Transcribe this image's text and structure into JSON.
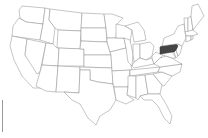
{
  "map": {
    "title": "United States",
    "highlighted_state": "Pennsylvania",
    "colors": {
      "fill": "#ffffff",
      "stroke": "#8c8c8c",
      "highlight": "#444444"
    },
    "states": [
      {
        "id": "WA",
        "name": "Washington",
        "d": "M22,6 L45,8 L43,24 L26,22 L20,18 L19,10 Z"
      },
      {
        "id": "OR",
        "name": "Oregon",
        "d": "M19,18 L26,22 L43,24 L40,40 L12,36 L13,26 Z"
      },
      {
        "id": "CA",
        "name": "California",
        "d": "M12,36 L27,39 L25,55 L44,80 L42,88 L33,88 L22,76 L14,60 L10,46 Z"
      },
      {
        "id": "NV",
        "name": "Nevada",
        "d": "M27,39 L46,43 L40,72 L37,74 L25,55 Z"
      },
      {
        "id": "ID",
        "name": "Idaho",
        "d": "M45,8 L50,9 L49,20 L55,28 L53,44 L40,40 L43,24 Z"
      },
      {
        "id": "MT",
        "name": "Montana",
        "d": "M50,9 L82,13 L81,31 L58,30 L55,28 L49,20 Z"
      },
      {
        "id": "WY",
        "name": "Wyoming",
        "d": "M58,30 L81,31 L80,49 L57,48 Z"
      },
      {
        "id": "UT",
        "name": "Utah",
        "d": "M46,43 L53,44 L57,48 L59,48 L58,66 L42,65 Z"
      },
      {
        "id": "AZ",
        "name": "Arizona",
        "d": "M42,65 L58,66 L56,92 L46,91 L36,86 L40,72 Z"
      },
      {
        "id": "CO",
        "name": "Colorado",
        "d": "M59,48 L84,49 L84,66 L58,66 Z"
      },
      {
        "id": "NM",
        "name": "New Mexico",
        "d": "M58,66 L80,67 L79,93 L64,92 L56,92 Z"
      },
      {
        "id": "ND",
        "name": "North Dakota",
        "d": "M82,13 L104,14 L106,28 L81,28 Z"
      },
      {
        "id": "SD",
        "name": "South Dakota",
        "d": "M81,28 L106,28 L107,42 L81,41 Z"
      },
      {
        "id": "NE",
        "name": "Nebraska",
        "d": "M81,41 L107,42 L111,55 L84,55 L84,49 L80,49 Z"
      },
      {
        "id": "KS",
        "name": "Kansas",
        "d": "M84,55 L111,55 L112,68 L84,67 Z"
      },
      {
        "id": "OK",
        "name": "Oklahoma",
        "d": "M80,67 L112,68 L113,84 L98,82 L90,80 L90,70 L80,70 Z"
      },
      {
        "id": "TX",
        "name": "Texas",
        "d": "M80,70 L90,70 L90,80 L98,82 L113,84 L116,100 L110,110 L100,116 L96,125 L88,118 L80,104 L72,100 L64,92 L79,93 Z"
      },
      {
        "id": "MN",
        "name": "Minnesota",
        "d": "M104,14 L112,14 L123,18 L117,24 L116,38 L107,38 L106,28 Z"
      },
      {
        "id": "IA",
        "name": "Iowa",
        "d": "M107,38 L124,38 L126,48 L110,52 L107,42 Z"
      },
      {
        "id": "MO",
        "name": "Missouri",
        "d": "M110,52 L126,48 L130,60 L132,70 L112,71 L111,55 Z"
      },
      {
        "id": "AR",
        "name": "Arkansas",
        "d": "M112,71 L130,70 L128,87 L114,87 L113,84 Z"
      },
      {
        "id": "LA",
        "name": "Louisiana",
        "d": "M114,87 L128,87 L127,95 L134,100 L126,104 L116,100 Z"
      },
      {
        "id": "WI",
        "name": "Wisconsin",
        "d": "M116,24 L125,26 L132,30 L130,42 L124,38 L116,38 Z"
      },
      {
        "id": "IL",
        "name": "Illinois",
        "d": "M124,38 L130,40 L133,54 L132,66 L128,62 L126,48 Z"
      },
      {
        "id": "MI",
        "name": "Michigan",
        "d": "M125,26 L138,22 L144,30 L146,40 L134,42 L132,30 Z"
      },
      {
        "id": "IN",
        "name": "Indiana",
        "d": "M133,44 L140,44 L140,58 L134,62 L133,54 Z"
      },
      {
        "id": "OH",
        "name": "Ohio",
        "d": "M140,44 L150,42 L154,46 L152,56 L146,60 L140,58 Z"
      },
      {
        "id": "KY",
        "name": "Kentucky",
        "d": "M132,66 L134,62 L140,58 L146,60 L152,58 L154,64 L134,68 Z"
      },
      {
        "id": "TN",
        "name": "Tennessee",
        "d": "M130,70 L160,67 L158,72 L130,76 Z"
      },
      {
        "id": "MS",
        "name": "Mississippi",
        "d": "M128,76 L136,76 L136,98 L127,95 L128,87 Z"
      },
      {
        "id": "AL",
        "name": "Alabama",
        "d": "M136,76 L145,75 L148,94 L140,96 L138,100 L136,98 Z"
      },
      {
        "id": "GA",
        "name": "Georgia",
        "d": "M145,75 L153,74 L162,85 L160,94 L148,94 Z"
      },
      {
        "id": "FL",
        "name": "Florida",
        "d": "M140,96 L148,94 L160,94 L166,104 L172,116 L170,124 L164,118 L158,106 L152,100 L144,100 Z"
      },
      {
        "id": "SC",
        "name": "South Carolina",
        "d": "M153,74 L162,72 L172,76 L164,86 L162,85 Z"
      },
      {
        "id": "NC",
        "name": "North Carolina",
        "d": "M158,72 L160,67 L182,64 L180,72 L172,76 L162,72 Z"
      },
      {
        "id": "VA",
        "name": "Virginia",
        "d": "M154,64 L160,58 L166,56 L172,58 L178,62 L182,64 L160,67 Z"
      },
      {
        "id": "WV",
        "name": "West Virginia",
        "d": "M152,56 L156,52 L160,54 L164,54 L160,58 L154,64 L152,58 Z"
      },
      {
        "id": "MD",
        "name": "Maryland",
        "d": "M160,54 L172,52 L176,58 L172,58 L166,56 Z"
      },
      {
        "id": "DE",
        "name": "Delaware",
        "d": "M176,50 L178,56 L176,58 L174,52 Z"
      },
      {
        "id": "NJ",
        "name": "New Jersey",
        "d": "M178,44 L182,46 L180,54 L178,56 L176,50 Z"
      },
      {
        "id": "PA",
        "name": "Pennsylvania",
        "d": "M160,47 L162,46 L176,44 L178,46 L176,50 L174,52 L172,52 L160,54 Z",
        "highlight": true
      },
      {
        "id": "NY",
        "name": "New York",
        "d": "M162,46 L164,38 L174,34 L178,26 L184,24 L186,38 L184,42 L182,46 L178,44 L176,44 Z"
      },
      {
        "id": "VT",
        "name": "Vermont",
        "d": "M184,18 L188,18 L188,32 L185,32 Z"
      },
      {
        "id": "NH",
        "name": "New Hampshire",
        "d": "M188,18 L191,16 L193,30 L188,32 Z"
      },
      {
        "id": "ME",
        "name": "Maine",
        "d": "M191,16 L192,6 L198,4 L204,16 L196,26 L193,30 Z"
      },
      {
        "id": "MA",
        "name": "Massachusetts",
        "d": "M185,32 L193,30 L198,34 L192,36 L186,36 Z"
      },
      {
        "id": "CT",
        "name": "Connecticut",
        "d": "M186,36 L191,36 L191,40 L186,42 Z"
      },
      {
        "id": "RI",
        "name": "Rhode Island",
        "d": "M191,36 L193,36 L193,39 L191,40 Z"
      }
    ]
  }
}
